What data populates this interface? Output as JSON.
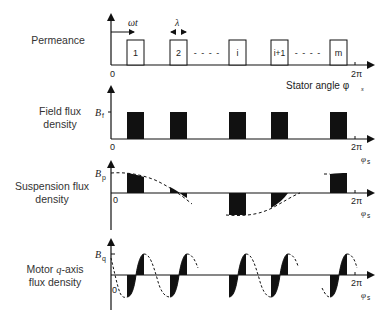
{
  "figure": {
    "panels": [
      {
        "id": "permeance",
        "label": "Permeance",
        "origin_label": "0",
        "end_label": "2π",
        "x_axis_label": "Stator angle φ",
        "x_axis_sub": "s",
        "time_arrow_label": "ωt",
        "width_label": "λ",
        "poles": [
          "1",
          "2",
          "i",
          "i+1",
          "m"
        ],
        "ellipsis": "- - - -"
      },
      {
        "id": "field-flux-density",
        "label_line1": "Field flux",
        "label_line2": "density",
        "y_symbol": "B",
        "y_sub": "f",
        "origin_label": "0",
        "end_label": "2π",
        "x_symbol": "φ",
        "x_sub": "s"
      },
      {
        "id": "suspension-flux-density",
        "label_line1": "Suspension flux",
        "label_line2": "density",
        "y_symbol": "B",
        "y_sub": "p",
        "origin_label": "0",
        "end_label": "2π",
        "x_symbol": "φ",
        "x_sub": "s"
      },
      {
        "id": "motor-q-axis-flux-density",
        "label_line1_a": "Motor ",
        "label_line1_q": "q",
        "label_line1_b": "-axis",
        "label_line2": "flux density",
        "y_symbol": "B",
        "y_sub": "q",
        "origin_label": "0",
        "end_label": "2π",
        "x_symbol": "φ",
        "x_sub": "s"
      }
    ],
    "colors": {
      "ink": "#111111",
      "text": "#333333",
      "background": "#ffffff"
    }
  }
}
